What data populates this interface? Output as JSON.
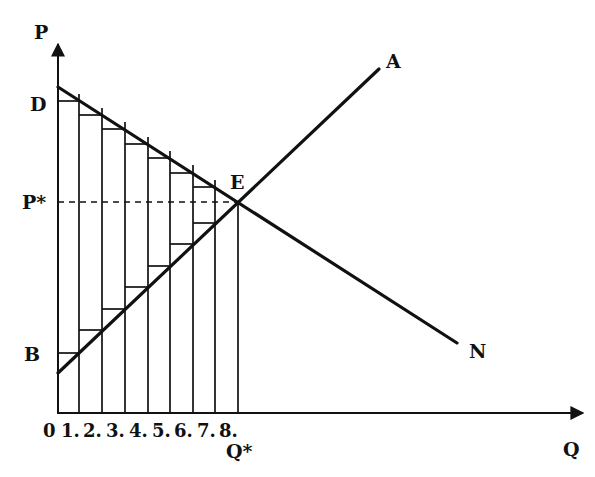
{
  "diagram": {
    "title": "",
    "axes": {
      "y_label": "P",
      "x_label": "Q",
      "origin_label": "0"
    },
    "price_labels": {
      "demand_intercept": "D",
      "equilibrium_price": "P*",
      "supply_intercept": "B"
    },
    "quantity_labels": {
      "ticks": [
        "1.",
        "2.",
        "3.",
        "4.",
        "5.",
        "6.",
        "7.",
        "8."
      ],
      "equilibrium_quantity": "Q*"
    },
    "curves": {
      "demand": {
        "label": "N",
        "from": "D",
        "to": "N",
        "type": "downward sloping"
      },
      "supply": {
        "label": "A",
        "from": "B",
        "to": "A",
        "type": "upward sloping"
      }
    },
    "equilibrium": {
      "label": "E",
      "price": "P*",
      "quantity": "Q*"
    },
    "bars": {
      "count": 8,
      "description": "Unit-width rectangles from Q=0 to Q*, with horizontal steps under the demand curve and above the supply curve"
    }
  }
}
